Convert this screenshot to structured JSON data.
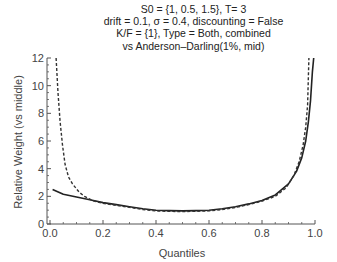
{
  "chart_data": {
    "type": "line",
    "title_lines": [
      "S0 = {1, 0.5, 1.5}, T= 3",
      "drift = 0.1, σ = 0.4, discounting = False",
      "K/F = {1}, Type = Both, combined",
      "vs Anderson–Darling(1%, mid)"
    ],
    "xlabel": "Quantiles",
    "ylabel": "Relative Weight (vs middle)",
    "xlim": [
      0.0,
      1.0
    ],
    "ylim": [
      0,
      12
    ],
    "xticks": [
      "0.0",
      "0.2",
      "0.4",
      "0.6",
      "0.8",
      "1.0"
    ],
    "yticks": [
      "0",
      "2",
      "4",
      "6",
      "8",
      "10",
      "12"
    ],
    "grid": false,
    "legend": null,
    "series": [
      {
        "name": "combined",
        "style": "solid",
        "color": "#222222",
        "x": [
          0.01,
          0.05,
          0.1,
          0.15,
          0.2,
          0.25,
          0.3,
          0.35,
          0.4,
          0.45,
          0.5,
          0.55,
          0.6,
          0.65,
          0.7,
          0.75,
          0.8,
          0.85,
          0.9,
          0.93,
          0.95,
          0.965,
          0.975,
          0.983,
          0.99,
          0.995
        ],
        "y": [
          2.5,
          2.15,
          1.95,
          1.75,
          1.55,
          1.4,
          1.25,
          1.1,
          1.0,
          0.97,
          0.95,
          0.97,
          1.0,
          1.1,
          1.25,
          1.45,
          1.7,
          2.1,
          2.9,
          3.8,
          4.8,
          6.0,
          7.4,
          8.9,
          11.0,
          12.0
        ]
      },
      {
        "name": "Anderson–Darling(1%, mid)",
        "style": "dashed",
        "color": "#333333",
        "x": [
          0.023,
          0.03,
          0.038,
          0.047,
          0.057,
          0.07,
          0.085,
          0.11,
          0.13,
          0.16,
          0.2,
          0.25,
          0.3,
          0.35,
          0.4,
          0.45,
          0.5,
          0.55,
          0.6,
          0.65,
          0.7,
          0.75,
          0.8,
          0.85,
          0.89,
          0.92,
          0.94,
          0.955,
          0.965,
          0.972,
          0.977
        ],
        "y": [
          12.0,
          9.5,
          7.4,
          5.7,
          4.3,
          3.4,
          2.9,
          2.3,
          2.0,
          1.7,
          1.5,
          1.35,
          1.2,
          1.05,
          0.95,
          0.92,
          0.9,
          0.92,
          0.95,
          1.05,
          1.2,
          1.4,
          1.65,
          2.0,
          2.6,
          3.5,
          4.5,
          5.7,
          7.0,
          8.6,
          12.0
        ]
      }
    ]
  },
  "colors": {
    "background": "#ffffff",
    "axis": "#555555",
    "text": "#333333"
  }
}
